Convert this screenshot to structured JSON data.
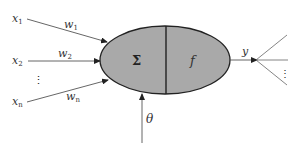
{
  "diagram": {
    "colors": {
      "neuron_fill": "#a9a9a9",
      "stroke": "#222222",
      "line": "#555555",
      "background": "#ffffff"
    },
    "inputs": [
      {
        "name": "x",
        "sub": "1",
        "weight": "w",
        "weight_sub": "1"
      },
      {
        "name": "x",
        "sub": "2",
        "weight": "w",
        "weight_sub": "2"
      },
      {
        "name": "x",
        "sub": "n",
        "weight": "w",
        "weight_sub": "n"
      }
    ],
    "input_ellipsis": "⋮",
    "neuron": {
      "sum_symbol": "Σ",
      "activation_symbol": "f"
    },
    "bias": {
      "label": "θ"
    },
    "output": {
      "label": "y",
      "ellipsis": "⋮"
    }
  }
}
